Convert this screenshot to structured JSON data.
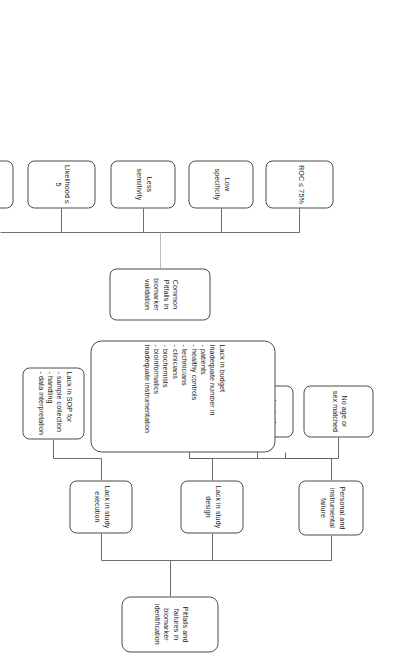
{
  "diagram": {
    "title": "Pitfalls and failures in biomarker identification",
    "type": "flowchart",
    "orientation": "rotated-90",
    "colors": {
      "node_border": "#4a4a4a",
      "node_fill": "#ffffff",
      "connector": "#5d5d5d",
      "text": "#1d1d1d",
      "page_background": "#ffffff"
    },
    "trees": [
      {
        "root": "Pitfalls and failures in biomarker identification",
        "branches": [
          {
            "label": "Lack in study design",
            "children": [
              "Small numbers of sample",
              "Lack of information / sample history",
              "No age or sex matched"
            ]
          },
          {
            "label": "Lack in study execution",
            "children": [
              "Lack in SOP for\n- sample collection\n- handling\n- data interpretation"
            ]
          },
          {
            "label": "Personal and instrumental failure",
            "children": [
              "Lack in budget\nInadequate number in\n- patients\n- healthy controls\n- technicians\n- clinicians\n- biochemists\n- bioinformatics\nInadequate instrumentation"
            ]
          }
        ]
      },
      {
        "root": "Common Pitfalls in biomarker validation",
        "branches": [
          {
            "label": "Less sensitivity",
            "children": []
          },
          {
            "label": "Low specificity",
            "children": []
          },
          {
            "label": "ROC ≤ 75%",
            "children": []
          },
          {
            "label": "Likelihood ≤ 5",
            "children": []
          },
          {
            "label": "Odd ratio ≤ 1",
            "children": []
          }
        ]
      }
    ]
  },
  "nodes": {
    "root": "Pitfalls and failures in biomarker identification",
    "study_design": "Lack in study design",
    "study_execution": "Lack in study execution",
    "personal_instrumental": "Personal and instrumental failure",
    "small_numbers": "Small numbers of sample",
    "lack_information": "Lack of information / sample history",
    "no_age_sex": "No age or sex matched",
    "lack_sop": "Lack in SOP for\n- sample collection\n- handling\n- data interpretation",
    "lack_budget": "Lack in budget\nInadequate number in\n- patients\n- healthy controls\n- technicians\n- clinicians\n- biochemists\n- bioinformatics\nInadequate instrumentation",
    "common_pitfalls": "Common Pitfalls in biomarker validation",
    "less_sensitivity": "Less sensitivity",
    "low_specificity": "Low specificity",
    "roc": "ROC ≤ 75%",
    "likelihood": "Likelihood ≤ 5",
    "odd_ratio": "Odd ratio ≤ 1"
  }
}
